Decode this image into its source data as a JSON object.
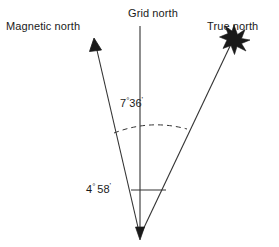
{
  "diagram": {
    "title_present": false,
    "background_color": "#ffffff",
    "line_color": "#333333",
    "text_color": "#1a1a1a",
    "labels": {
      "magnetic_north": "Magnetic north",
      "grid_north": "Grid north",
      "true_north": "True north"
    },
    "angles": {
      "grid_to_magnetic": {
        "degrees": "7",
        "degree_symbol": "°",
        "minutes": "36",
        "minute_symbol": "'",
        "full_text": "7°36'",
        "spaced": false
      },
      "grid_to_true": {
        "degrees": "4",
        "degree_symbol": "°",
        "minutes": "58",
        "minute_symbol": "'",
        "full_text": "4° 58'",
        "spaced": true
      }
    },
    "markers": {
      "magnetic_north_marker": "arrowhead",
      "grid_north_marker": "plain-line",
      "true_north_marker": "star-burst",
      "origin_marker": "arrowhead-down"
    },
    "arc": {
      "style": "dashed",
      "spans": "magnetic-north-line to true-north-line"
    },
    "leader_line": {
      "style": "solid-horizontal",
      "from": "4° 58' label",
      "to": "grid-north-line"
    }
  }
}
